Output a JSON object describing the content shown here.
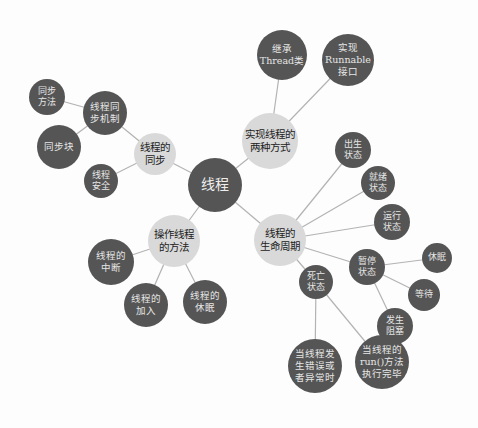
{
  "diagram": {
    "type": "mind-map",
    "colors": {
      "dark_node": "#555555",
      "light_node": "#d9d9d9",
      "edge": "#b3b3b3",
      "background": "#fdfdfd"
    },
    "root": {
      "id": "root",
      "label": "线程",
      "x": 215,
      "y": 185,
      "r": 27
    },
    "nodes": [
      {
        "id": "sync",
        "label": "线程的\n同步",
        "x": 155,
        "y": 154,
        "r": 21,
        "style": "light",
        "parent": "root"
      },
      {
        "id": "sync_mech",
        "label": "线程同\n步机制",
        "x": 105,
        "y": 113,
        "r": 22,
        "style": "dark",
        "parent": "sync"
      },
      {
        "id": "sync_method",
        "label": "同步\n方法",
        "x": 47,
        "y": 97,
        "r": 18,
        "style": "dark",
        "parent": "sync_mech"
      },
      {
        "id": "sync_block",
        "label": "同步块",
        "x": 59,
        "y": 147,
        "r": 22,
        "style": "dark",
        "parent": "sync_mech"
      },
      {
        "id": "thread_safe",
        "label": "线程\n安全",
        "x": 101,
        "y": 181,
        "r": 17,
        "style": "dark",
        "parent": "sync"
      },
      {
        "id": "two_ways",
        "label": "实现线程的\n两种方式",
        "x": 270,
        "y": 141,
        "r": 28,
        "style": "light",
        "parent": "root"
      },
      {
        "id": "extend_thread",
        "label": "继承\nThread类",
        "x": 282,
        "y": 55,
        "r": 25,
        "style": "dark",
        "parent": "two_ways"
      },
      {
        "id": "impl_runnable",
        "label": "实现\nRunnable\n接口",
        "x": 348,
        "y": 60,
        "r": 26,
        "style": "dark",
        "parent": "two_ways"
      },
      {
        "id": "lifecycle",
        "label": "线程的\n生命周期",
        "x": 280,
        "y": 240,
        "r": 26,
        "style": "light",
        "parent": "root"
      },
      {
        "id": "born",
        "label": "出生\n状态",
        "x": 353,
        "y": 150,
        "r": 18,
        "style": "dark",
        "parent": "lifecycle"
      },
      {
        "id": "ready",
        "label": "就绪\n状态",
        "x": 378,
        "y": 183,
        "r": 17,
        "style": "dark",
        "parent": "lifecycle"
      },
      {
        "id": "running",
        "label": "运行\n状态",
        "x": 392,
        "y": 222,
        "r": 18,
        "style": "dark",
        "parent": "lifecycle"
      },
      {
        "id": "paused",
        "label": "暂停\n状态",
        "x": 367,
        "y": 267,
        "r": 18,
        "style": "dark",
        "parent": "lifecycle"
      },
      {
        "id": "sleep",
        "label": "休眠",
        "x": 437,
        "y": 258,
        "r": 15,
        "style": "dark",
        "parent": "paused"
      },
      {
        "id": "wait",
        "label": "等待",
        "x": 424,
        "y": 295,
        "r": 16,
        "style": "dark",
        "parent": "paused"
      },
      {
        "id": "blocked",
        "label": "发生\n阻塞",
        "x": 395,
        "y": 326,
        "r": 18,
        "style": "dark",
        "parent": "paused"
      },
      {
        "id": "dead",
        "label": "死亡\n状态",
        "x": 316,
        "y": 282,
        "r": 17,
        "style": "dark",
        "parent": "lifecycle"
      },
      {
        "id": "dead_error",
        "label": "当线程发\n生错误或\n者异常时",
        "x": 315,
        "y": 366,
        "r": 27,
        "style": "dark",
        "parent": "dead"
      },
      {
        "id": "dead_run",
        "label": "当线程的\nrun()方法\n执行完毕",
        "x": 382,
        "y": 362,
        "r": 27,
        "style": "dark",
        "parent": "dead"
      },
      {
        "id": "ops",
        "label": "操作线程\n的方法",
        "x": 174,
        "y": 241,
        "r": 26,
        "style": "light",
        "parent": "root"
      },
      {
        "id": "interrupt",
        "label": "线程的\n中断",
        "x": 111,
        "y": 262,
        "r": 23,
        "style": "dark",
        "parent": "ops"
      },
      {
        "id": "join",
        "label": "线程的\n加入",
        "x": 146,
        "y": 305,
        "r": 22,
        "style": "dark",
        "parent": "ops"
      },
      {
        "id": "sleep_op",
        "label": "线程的\n休眠",
        "x": 205,
        "y": 302,
        "r": 22,
        "style": "dark",
        "parent": "ops"
      }
    ]
  }
}
